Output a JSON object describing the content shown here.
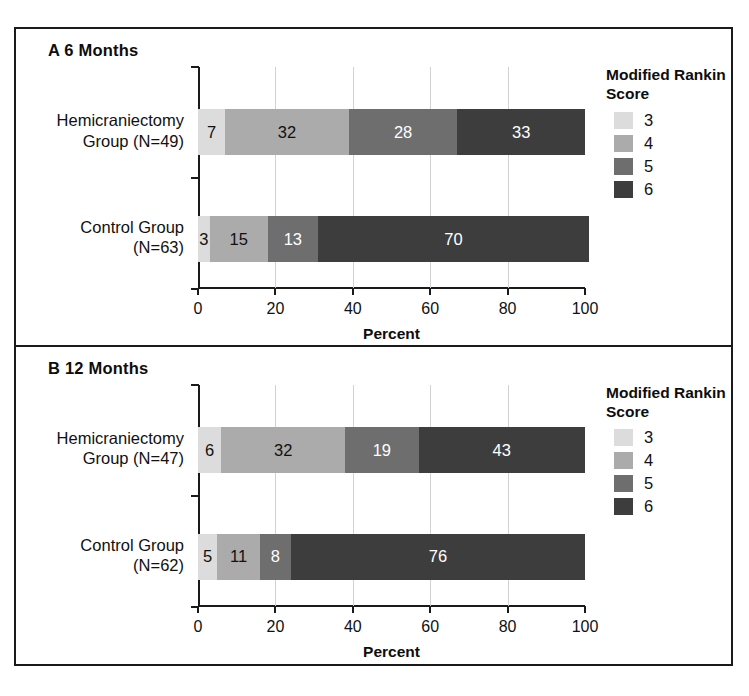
{
  "chart_data": {
    "type": "bar",
    "orientation": "horizontal",
    "stacked": true,
    "stacked_percent": true,
    "xlabel": "Percent",
    "ylabel": "",
    "xlim": [
      0,
      100
    ],
    "xticks": [
      0,
      20,
      40,
      60,
      80,
      100
    ],
    "xtick_labels": [
      "0",
      "20",
      "40",
      "60",
      "80",
      "100"
    ],
    "gridlines": [
      20,
      40,
      60,
      80
    ],
    "grid": true,
    "legend_title": "Modified Rankin Score",
    "legend_position": "right",
    "series": [
      {
        "name": "3",
        "color": "#dcdcdc",
        "label_color": "#111111"
      },
      {
        "name": "4",
        "color": "#ababab",
        "label_color": "#111111"
      },
      {
        "name": "5",
        "color": "#6e6e6e",
        "label_color": "#ffffff"
      },
      {
        "name": "6",
        "color": "#3d3d3d",
        "label_color": "#ffffff"
      }
    ],
    "panels": [
      {
        "id": "A",
        "title": "A 6 Months",
        "categories": [
          "Hemicraniectomy Group (N=49)",
          "Control Group (N=63)"
        ],
        "bars": [
          {
            "label_line1": "Hemicraniectomy",
            "label_line2": "Group (N=49)",
            "n": 49,
            "values": [
              7,
              32,
              28,
              33
            ]
          },
          {
            "label_line1": "Control Group",
            "label_line2": "(N=63)",
            "n": 63,
            "values": [
              3,
              15,
              13,
              70
            ]
          }
        ]
      },
      {
        "id": "B",
        "title": "B 12 Months",
        "categories": [
          "Hemicraniectomy Group (N=47)",
          "Control Group (N=62)"
        ],
        "bars": [
          {
            "label_line1": "Hemicraniectomy",
            "label_line2": "Group (N=47)",
            "n": 47,
            "values": [
              6,
              32,
              19,
              43
            ]
          },
          {
            "label_line1": "Control Group",
            "label_line2": "(N=62)",
            "n": 62,
            "values": [
              5,
              11,
              8,
              76
            ]
          }
        ]
      }
    ]
  }
}
